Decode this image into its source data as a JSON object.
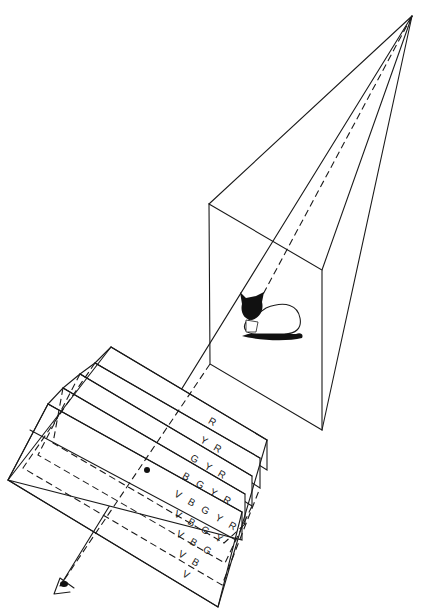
{
  "diagram": {
    "colors": {
      "ink": "#1a1a1a",
      "background": "#ffffff"
    },
    "apex": [
      412,
      16
    ],
    "eye": [
      60,
      586
    ],
    "box": {
      "top_left": [
        209,
        204
      ],
      "top_right": [
        322,
        270
      ],
      "bottom_right": [
        322,
        430
      ],
      "bottom_left": [
        210,
        364
      ]
    },
    "slabs": [
      {
        "label": "R",
        "style": "solid"
      },
      {
        "label": "Y R",
        "style": "solid"
      },
      {
        "label": "G Y R",
        "style": "solid"
      },
      {
        "label": "B G Y R",
        "style": "solid"
      },
      {
        "label": "V B G Y R",
        "style": "solid"
      },
      {
        "label": "V B G Y",
        "style": "dashed"
      },
      {
        "label": "V B G",
        "style": "dashed"
      },
      {
        "label": "V B",
        "style": "dashed"
      },
      {
        "label": "V",
        "style": "solid"
      }
    ],
    "focus_point": [
      147,
      470
    ],
    "icons": {
      "subject": "cat-icon",
      "viewer": "eye-icon"
    }
  }
}
